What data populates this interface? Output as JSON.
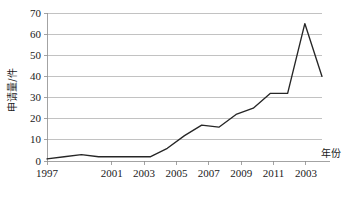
{
  "chart_data": {
    "type": "line",
    "title": "",
    "xlabel": "年份",
    "ylabel": "申请量/件",
    "ylim": [
      0,
      70
    ],
    "ytick_step": 10,
    "yticks": [
      "0",
      "10",
      "20",
      "30",
      "40",
      "50",
      "60",
      "70"
    ],
    "grid": true,
    "legend": "none",
    "x": [
      1997,
      1998,
      1999,
      2000,
      2001,
      2002,
      2003,
      2004,
      2005,
      2006,
      2007,
      2008,
      2009,
      2010,
      2011,
      2012,
      2013
    ],
    "xtick_labels": [
      "1997",
      "2001",
      "2003",
      "2005",
      "2007",
      "2009",
      "2011",
      "2003"
    ],
    "xtick_values": [
      1997,
      2001,
      2003,
      2005,
      2007,
      2009,
      2011,
      2013
    ],
    "series": [
      {
        "name": "申请量",
        "values": [
          1,
          2,
          3,
          2,
          2,
          2,
          2,
          6,
          12,
          17,
          16,
          22,
          25,
          32,
          32,
          65,
          40
        ]
      }
    ]
  },
  "axes": {
    "y_title": "申请量/件",
    "x_title": "年份"
  }
}
